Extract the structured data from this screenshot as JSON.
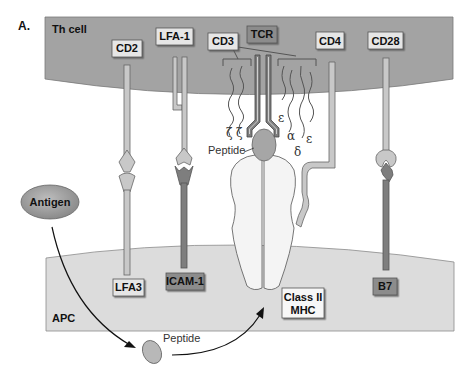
{
  "figure": {
    "panel_label": "A.",
    "colors": {
      "th_cell": "#a3a3a3",
      "apc": "#dcdcdc",
      "label_light": "#e6e6e6",
      "label_dark": "#8c8c8c",
      "molecule_light": "#c8c8c8",
      "molecule_dark": "#7e7e7e",
      "mhc": "#f4f4f4",
      "peptide": "#a6a6a6"
    }
  },
  "cells": {
    "th_cell": {
      "label": "Th cell"
    },
    "apc": {
      "label": "APC"
    }
  },
  "th_molecules": {
    "cd2": "CD2",
    "lfa1": "LFA-1",
    "cd3": "CD3",
    "tcr": "TCR",
    "cd4": "CD4",
    "cd28": "CD28"
  },
  "apc_molecules": {
    "lfa3": "LFA3",
    "icam1": "ICAM-1",
    "class2_mhc_line1": "Class II",
    "class2_mhc_line2": "MHC",
    "b7": "B7"
  },
  "cd3_chains": {
    "zeta1": "ζ",
    "zeta2": "ζ",
    "epsilon1": "ε",
    "alpha": "α",
    "delta": "δ",
    "epsilon2": "ε"
  },
  "antigen": {
    "label": "Antigen",
    "peptide_bound_label": "Peptide",
    "peptide_free_label": "Peptide"
  }
}
